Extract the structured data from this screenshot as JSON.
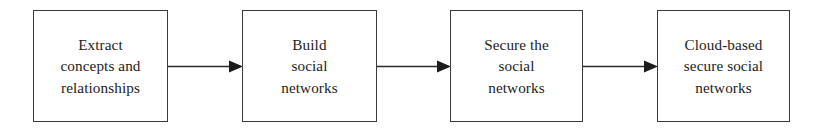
{
  "diagram": {
    "type": "linear-process-flow",
    "background_color": "#ffffff",
    "border_color": "#3a3a3a",
    "text_color": "#1c1c1c",
    "arrow_color": "#2b2b2b",
    "nodes": [
      {
        "id": "extract-concepts-and-relationships",
        "label": "Extract\nconcepts and\nrelationships",
        "lines": [
          "Extract",
          "concepts and",
          "relationships"
        ]
      },
      {
        "id": "build-social-networks",
        "label": "Build\nsocial\nnetworks",
        "lines": [
          "Build",
          "social",
          "networks"
        ]
      },
      {
        "id": "secure-the-social-networks",
        "label": "Secure the\nsocial\nnetworks",
        "lines": [
          "Secure the",
          "social",
          "networks"
        ]
      },
      {
        "id": "cloud-based-secure-social-networks",
        "label": "Cloud-based\nsecure social\nnetworks",
        "lines": [
          "Cloud-based",
          "secure social",
          "networks"
        ]
      }
    ],
    "connectors": [
      {
        "id": "arrow-1",
        "from": "extract-concepts-and-relationships",
        "to": "build-social-networks",
        "style": "solid-filled-arrowhead"
      },
      {
        "id": "arrow-2",
        "from": "build-social-networks",
        "to": "secure-the-social-networks",
        "style": "solid-filled-arrowhead"
      },
      {
        "id": "arrow-3",
        "from": "secure-the-social-networks",
        "to": "cloud-based-secure-social-networks",
        "style": "solid-filled-arrowhead"
      }
    ]
  }
}
